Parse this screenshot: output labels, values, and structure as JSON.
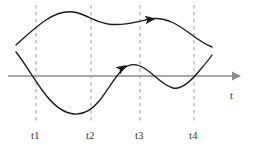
{
  "figure": {
    "background_color": "#ffffff",
    "width": 255,
    "height": 153,
    "curve_color": "#1a1a1a",
    "axis_color": "#8c8c8c",
    "gridline_color": "#9a9a9a",
    "label_color": "#3a3a3a"
  },
  "axis": {
    "label": "t",
    "label_x": 230,
    "label_y": 90,
    "line_y": 76,
    "line_x_start": 8,
    "line_x_end": 240,
    "arrow_tip_x": 247,
    "has_arrow": true
  },
  "gridlines": [
    {
      "id": "t1",
      "label": "t1",
      "x": 36,
      "y_top": 5,
      "y_bottom": 122,
      "label_x": 31,
      "label_y": 130
    },
    {
      "id": "t2",
      "label": "t2",
      "x": 91,
      "y_top": 5,
      "y_bottom": 122,
      "label_x": 86,
      "label_y": 130
    },
    {
      "id": "t3",
      "label": "t3",
      "x": 140,
      "y_top": 5,
      "y_bottom": 122,
      "label_x": 135,
      "label_y": 130
    },
    {
      "id": "t4",
      "label": "t4",
      "x": 194,
      "y_top": 5,
      "y_bottom": 122,
      "label_x": 189,
      "label_y": 130
    }
  ],
  "curves": [
    {
      "id": "upper-curve",
      "name": "upper-trajectory",
      "path": "M 16 45 C 24 38, 34 28, 46 20 C 58 12, 68 10, 78 13 C 88 16, 96 22, 108 24 C 122 26, 136 22, 150 19 C 166 16, 180 26, 192 35 C 200 41, 207 45, 212 47",
      "arrow": {
        "x": 156,
        "y": 18.5,
        "angle": -8
      }
    },
    {
      "id": "lower-curve",
      "name": "lower-trajectory",
      "path": "M 16 52 C 24 62, 32 76, 42 90 C 52 104, 62 113, 74 114 C 84 115, 92 110, 100 100 C 108 90, 114 78, 122 70 C 128 64, 136 63, 144 68 C 154 74, 162 85, 173 88 C 182 90, 192 80, 200 70 C 206 63, 210 58, 212 55",
      "arrow": {
        "x": 127,
        "y": 65,
        "angle": -32
      }
    }
  ]
}
